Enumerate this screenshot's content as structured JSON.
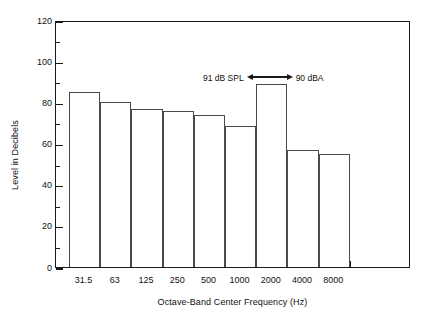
{
  "chart_data": {
    "type": "bar",
    "title": "",
    "xlabel": "Octave-Band Center Frequency (Hz)",
    "ylabel": "Level in Decibels",
    "categories": [
      "31.5",
      "63",
      "125",
      "250",
      "500",
      "1000",
      "2000",
      "4000",
      "8000"
    ],
    "values": [
      85,
      80,
      77,
      76,
      74,
      68.5,
      89,
      57,
      55
    ],
    "ylim": [
      0,
      120
    ],
    "ytick_labels": [
      "0",
      "20",
      "40",
      "60",
      "80",
      "100",
      "120"
    ],
    "ytick_values": [
      0,
      20,
      40,
      60,
      80,
      100,
      120
    ],
    "yminor_values": [
      10,
      30,
      50,
      70,
      90,
      110
    ],
    "grid": false,
    "legend": "none",
    "bar_style": {
      "fill": "#ffffff",
      "edge": "#4a4a4a",
      "touching": true
    },
    "annotations": [
      {
        "name": "spl-vs-dba-annotation",
        "left_text": "91 dB SPL",
        "right_text": "90 dBA",
        "arrow": "double-headed-horizontal",
        "approx_level": 93
      }
    ]
  },
  "axes": {
    "y_title": "Level in Decibels",
    "x_title": "Octave-Band Center Frequency (Hz)"
  },
  "colors": {
    "background": "#ffffff",
    "axis": "#1a1a1a",
    "bar_edge": "#4a4a4a",
    "text": "#111111"
  }
}
